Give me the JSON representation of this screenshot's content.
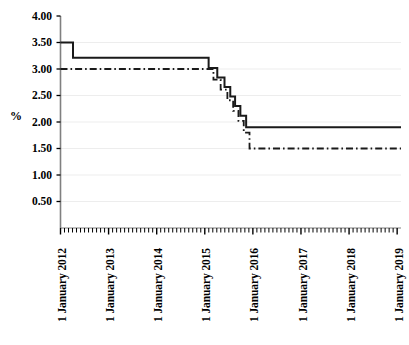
{
  "chart_data": {
    "type": "line",
    "title": "",
    "xlabel": "",
    "ylabel": "%",
    "ylim": [
      0,
      4.0
    ],
    "yticks": [
      "0.50",
      "1.00",
      "1.50",
      "2.00",
      "2.50",
      "3.00",
      "3.50",
      "4.00"
    ],
    "ytick_values": [
      0.5,
      1.0,
      1.5,
      2.0,
      2.5,
      3.0,
      3.5,
      4.0
    ],
    "xticks": [
      "1 January 2012",
      "1 January 2013",
      "1 January 2014",
      "1 January 2015",
      "1 January 2016",
      "1 January 2017",
      "1 January 2018",
      "1 January 2019"
    ],
    "xtick_values": [
      2012,
      2013,
      2014,
      2015,
      2016,
      2017,
      2018,
      2019
    ],
    "xlim": [
      2012,
      2019.08
    ],
    "grid": true,
    "grid_axis": "y",
    "legend": "none",
    "series": [
      {
        "name": "solid-series",
        "style": "solid",
        "color": "#1a1a1a",
        "width": 2.0,
        "step": "post",
        "x": [
          2012.0,
          2012.26,
          2012.26,
          2015.08,
          2015.08,
          2015.26,
          2015.26,
          2015.41,
          2015.41,
          2015.53,
          2015.53,
          2015.63,
          2015.63,
          2015.74,
          2015.74,
          2015.86,
          2015.86,
          2019.08
        ],
        "y": [
          3.5,
          3.5,
          3.21,
          3.21,
          3.02,
          3.02,
          2.84,
          2.84,
          2.66,
          2.66,
          2.48,
          2.48,
          2.3,
          2.3,
          2.12,
          2.12,
          1.9,
          1.9
        ]
      },
      {
        "name": "dashdot-series",
        "style": "dashdot",
        "color": "#1a1a1a",
        "width": 1.8,
        "step": "post",
        "x": [
          2012.0,
          2012.28,
          2012.28,
          2015.18,
          2015.18,
          2015.33,
          2015.33,
          2015.47,
          2015.47,
          2015.59,
          2015.59,
          2015.7,
          2015.7,
          2015.81,
          2015.81,
          2015.93,
          2015.93,
          2019.08
        ],
        "y": [
          3.0,
          3.0,
          3.0,
          3.0,
          2.8,
          2.8,
          2.61,
          2.61,
          2.41,
          2.41,
          2.21,
          2.21,
          2.02,
          2.02,
          1.8,
          1.8,
          1.5,
          1.5
        ]
      }
    ]
  },
  "axes": {
    "y_label": "%",
    "axis_color": "#808080",
    "tick_color": "#000000",
    "grid_color": "#ededed"
  }
}
